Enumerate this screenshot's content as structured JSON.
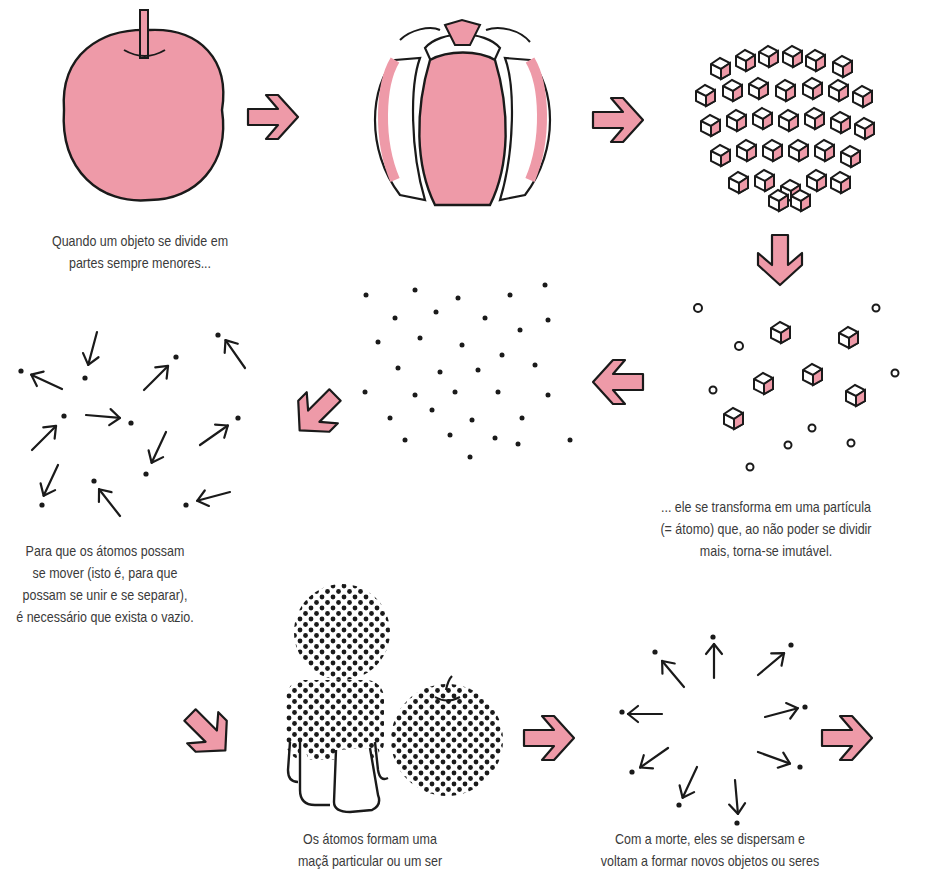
{
  "colors": {
    "pink": "#ee9aa8",
    "outline": "#1a1a1a",
    "text": "#3a3a3a",
    "background": "#ffffff"
  },
  "diagram": {
    "type": "process-flow",
    "topic": "Atomismo: divisão da matéria em átomos",
    "steps": [
      {
        "id": "apple-whole",
        "icon": "apple-icon"
      },
      {
        "id": "apple-segments",
        "icon": "apple-segments-icon"
      },
      {
        "id": "apple-fragments",
        "icon": "cube-fragments-icon"
      },
      {
        "id": "scattered-atoms",
        "icon": "scattered-cubes-icon"
      },
      {
        "id": "void-dots",
        "icon": "dot-field-icon"
      },
      {
        "id": "moving-atoms",
        "icon": "moving-atoms-icon"
      },
      {
        "id": "formed-beings",
        "icon": "dotted-person-apple-icon"
      },
      {
        "id": "dispersing-atoms",
        "icon": "dispersing-atoms-icon"
      }
    ],
    "arrows": [
      "right",
      "right",
      "down",
      "left",
      "down-left",
      "down-right",
      "right",
      "right"
    ]
  },
  "captions": {
    "division": [
      "Quando um objeto se divide em",
      "partes sempre menores..."
    ],
    "atom": [
      "... ele se transforma em uma partícula",
      "(= átomo) que, ao não poder se dividir",
      "mais, torna-se imutável."
    ],
    "void": [
      "Para que os átomos possam",
      "se mover (isto é, para que",
      "possam se unir e se separar),",
      "é necessário que exista o vazio."
    ],
    "formation": [
      "Os átomos formam uma",
      "maçã particular ou um ser"
    ],
    "death": [
      "Com a morte, eles se dispersam e",
      "voltam a formar novos objetos ou seres"
    ]
  }
}
